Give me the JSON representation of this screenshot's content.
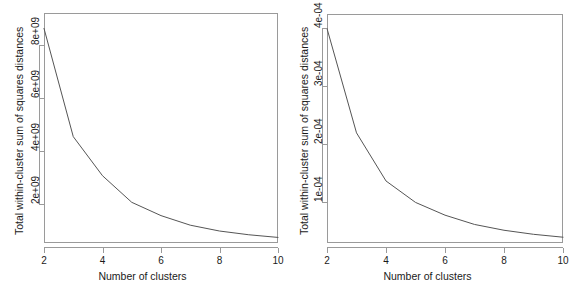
{
  "figure": {
    "background": "#ffffff",
    "axis_color": "#9a9a9a",
    "line_color": "#555555",
    "text_color": "#1a1a1a"
  },
  "panels": [
    {
      "id": "left",
      "name": "elbow-plot-left",
      "xlabel": "Number of clusters",
      "ylabel": "Total within-cluster sum of squares distances",
      "xticks": [
        "2",
        "4",
        "6",
        "8",
        "10"
      ],
      "yticks": [
        "2e+09",
        "4e+09",
        "6e+09",
        "8e+09"
      ]
    },
    {
      "id": "right",
      "name": "elbow-plot-right",
      "xlabel": "Number of clusters",
      "ylabel": "Total within-cluster sum of squares distances",
      "xticks": [
        "2",
        "4",
        "6",
        "8",
        "10"
      ],
      "yticks": [
        "1e-04",
        "2e-04",
        "3e-04",
        "4e-04"
      ]
    }
  ],
  "chart_data": [
    {
      "type": "line",
      "id": "left",
      "title": "",
      "xlabel": "Number of clusters",
      "ylabel": "Total within-cluster sum of squares distances",
      "x": [
        2,
        3,
        4,
        5,
        6,
        7,
        8,
        9,
        10
      ],
      "y": [
        8620000000.0,
        4550000000.0,
        3080000000.0,
        2080000000.0,
        1580000000.0,
        1220000000.0,
        1000000000.0,
        860000000.0,
        760000000.0
      ],
      "xlim": [
        2,
        10
      ],
      "ylim": [
        550000000.0,
        9200000000.0
      ],
      "xticks": [
        2,
        4,
        6,
        8,
        10
      ],
      "yticks": [
        2000000000.0,
        4000000000.0,
        6000000000.0,
        8000000000.0
      ],
      "ytick_labels": [
        "2e+09",
        "4e+09",
        "6e+09",
        "8e+09"
      ],
      "xtick_labels": [
        "2",
        "4",
        "6",
        "8",
        "10"
      ],
      "grid": false,
      "legend": false,
      "series": [
        {
          "name": "total within-cluster sum of squares",
          "values": [
            8620000000.0,
            4550000000.0,
            3080000000.0,
            2080000000.0,
            1580000000.0,
            1220000000.0,
            1000000000.0,
            860000000.0,
            760000000.0
          ]
        }
      ]
    },
    {
      "type": "line",
      "id": "right",
      "title": "",
      "xlabel": "Number of clusters",
      "ylabel": "Total within-cluster sum of squares distances",
      "x": [
        2,
        3,
        4,
        5,
        6,
        7,
        8,
        9,
        10
      ],
      "y": [
        0.0004,
        0.00022,
        0.000137,
        0.0001,
        7.8e-05,
        6.2e-05,
        5.2e-05,
        4.5e-05,
        4e-05
      ],
      "xlim": [
        2,
        10
      ],
      "ylim": [
        3e-05,
        0.000425
      ],
      "xticks": [
        2,
        4,
        6,
        8,
        10
      ],
      "yticks": [
        0.0001,
        0.0002,
        0.0003,
        0.0004
      ],
      "ytick_labels": [
        "1e-04",
        "2e-04",
        "3e-04",
        "4e-04"
      ],
      "xtick_labels": [
        "2",
        "4",
        "6",
        "8",
        "10"
      ],
      "grid": false,
      "legend": false,
      "series": [
        {
          "name": "total within-cluster sum of squares",
          "values": [
            0.0004,
            0.00022,
            0.000137,
            0.0001,
            7.8e-05,
            6.2e-05,
            5.2e-05,
            4.5e-05,
            4e-05
          ]
        }
      ]
    }
  ]
}
